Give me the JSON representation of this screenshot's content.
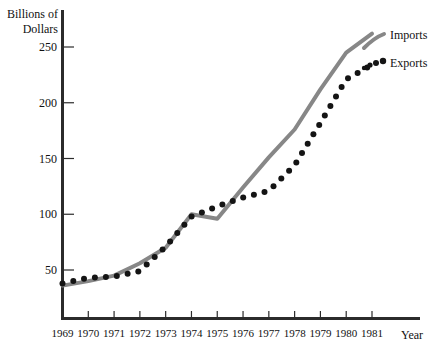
{
  "chart_data": {
    "type": "line",
    "title": "",
    "xlabel": "Year",
    "ylabel": "Billions of Dollars",
    "categories": [
      "1969",
      "1970",
      "1971",
      "1972",
      "1973",
      "1974",
      "1975",
      "1976",
      "1977",
      "1978",
      "1979",
      "1980",
      "1981"
    ],
    "x": [
      1969,
      1970,
      1971,
      1972,
      1973,
      1974,
      1975,
      1976,
      1977,
      1978,
      1979,
      1980,
      1981
    ],
    "ylim": [
      0,
      270
    ],
    "xlim": [
      1969,
      1981
    ],
    "yticks": [
      50,
      100,
      150,
      200,
      250
    ],
    "ytick_labels": [
      "50",
      "100",
      "150",
      "200",
      "250"
    ],
    "grid": false,
    "legend_position": "right-top",
    "series": [
      {
        "name": "Imports",
        "style": "solid-line",
        "color": "#878787",
        "values": [
          36,
          40,
          45,
          56,
          70,
          100,
          96,
          124,
          151,
          176,
          212,
          245,
          262
        ]
      },
      {
        "name": "Exports",
        "style": "dotted",
        "color": "#141414",
        "values": [
          38,
          43,
          44,
          49,
          71,
          98,
          107,
          115,
          121,
          144,
          182,
          221,
          234
        ]
      }
    ]
  },
  "axes": {
    "y_title_line1": "Billions of",
    "y_title_line2": "Dollars",
    "x_title": "Year"
  },
  "legend": {
    "imports_label": "Imports",
    "exports_label": "Exports"
  },
  "colors": {
    "imports": "#878787",
    "exports": "#141414",
    "axis": "#2b2b2b"
  }
}
